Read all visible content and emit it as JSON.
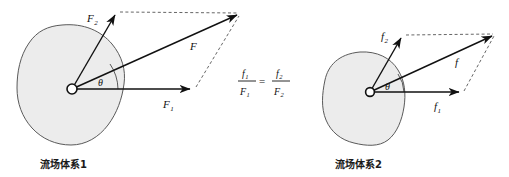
{
  "figure": {
    "background_color": "#ffffff",
    "blob_fill_color": "#ececec",
    "blob_stroke_color": "#5a5a5a",
    "vector_color": "#111111",
    "dashed_color": "#555555"
  },
  "left_panel": {
    "caption": "流场体系1",
    "origin_label": "O",
    "angle_label": "θ",
    "vectors": [
      {
        "name": "F2",
        "base": "F",
        "subscript": "2",
        "label": "F",
        "tip_x": 117,
        "tip_y": 12
      },
      {
        "name": "F1",
        "base": "F",
        "subscript": "1",
        "label": "F",
        "tip_x": 193,
        "tip_y": 89
      },
      {
        "name": "F",
        "base": "F",
        "subscript": "",
        "label": "F",
        "tip_x": 240,
        "tip_y": 13
      }
    ],
    "labels": {
      "F2_main": "F",
      "F2_sub": "2",
      "F1_main": "F",
      "F1_sub": "1",
      "F_main": "F"
    }
  },
  "center_formula": {
    "numerator_left_base": "f",
    "numerator_left_sub": "1",
    "denominator_left_base": "F",
    "denominator_left_sub": "1",
    "equals": "=",
    "numerator_right_base": "f",
    "numerator_right_sub": "2",
    "denominator_right_base": "F",
    "denominator_right_sub": "2",
    "plain_text": "f1/F1 = f2/F2"
  },
  "right_panel": {
    "caption": "流场体系2",
    "origin_label": "O",
    "angle_label": "θ",
    "vectors": [
      {
        "name": "f2",
        "base": "f",
        "subscript": "2",
        "label": "f",
        "tip_x": 403,
        "tip_y": 35
      },
      {
        "name": "f1",
        "base": "f",
        "subscript": "1",
        "label": "f",
        "tip_x": 462,
        "tip_y": 93
      },
      {
        "name": "f",
        "base": "f",
        "subscript": "",
        "label": "f",
        "tip_x": 495,
        "tip_y": 33
      }
    ],
    "labels": {
      "f2_main": "f",
      "f2_sub": "2",
      "f1_main": "f",
      "f1_sub": "1",
      "f_main": "f"
    }
  }
}
